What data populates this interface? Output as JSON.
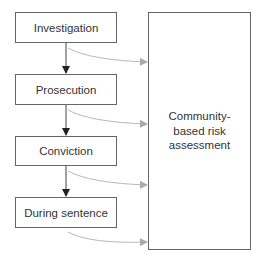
{
  "diagram": {
    "stages": [
      {
        "label": "Investigation"
      },
      {
        "label": "Prosecution"
      },
      {
        "label": "Conviction"
      },
      {
        "label": "During sentence"
      }
    ],
    "target": {
      "label": "Community-based risk assessment"
    },
    "colors": {
      "box_border": "#666666",
      "flow_arrow": "#333333",
      "feed_arrow": "#b0b0b0",
      "text": "#333333"
    }
  }
}
